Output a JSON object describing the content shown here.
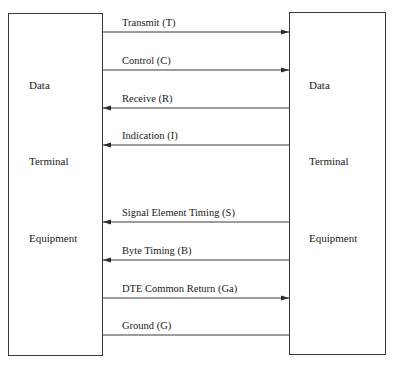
{
  "diagram": {
    "left_box": {
      "lines": [
        "Data",
        "Terminal",
        "Equipment"
      ]
    },
    "right_box": {
      "lines": [
        "Data",
        "Terminal",
        "Equipment"
      ]
    },
    "signals": [
      {
        "label": "Transmit (T)",
        "direction": "to-right",
        "y": 32
      },
      {
        "label": "Control (C)",
        "direction": "to-right",
        "y": 70
      },
      {
        "label": "Receive (R)",
        "direction": "to-left",
        "y": 108
      },
      {
        "label": "Indication (I)",
        "direction": "to-left",
        "y": 145
      },
      {
        "label": "Signal Element Timing (S)",
        "direction": "to-left",
        "y": 222
      },
      {
        "label": "Byte Timing (B)",
        "direction": "to-left",
        "y": 260
      },
      {
        "label": "DTE Common Return (Ga)",
        "direction": "to-right",
        "y": 298
      },
      {
        "label": "Ground (G)",
        "direction": "none",
        "y": 335
      }
    ],
    "colors": {
      "line": "#3a3a3a",
      "text": "#1a1a1a",
      "background": "#ffffff"
    }
  }
}
